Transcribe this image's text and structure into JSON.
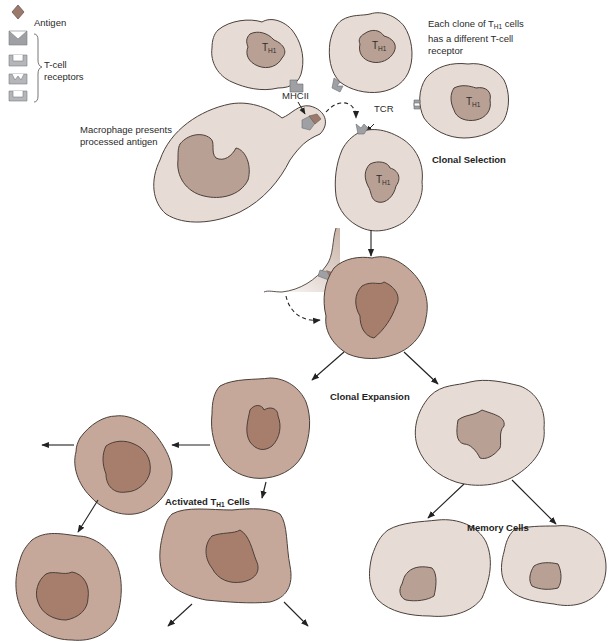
{
  "legend": {
    "antigen_label": "Antigen",
    "tcell_receptors_label_line1": "T-cell",
    "tcell_receptors_label_line2": "receptors"
  },
  "labels": {
    "clone_note_line1_prefix": "Each clone of T",
    "clone_note_line1_sub": "H1",
    "clone_note_line1_suffix": " cells",
    "clone_note_line2": "has a different T-cell",
    "clone_note_line3": "receptor",
    "mhcii": "MHCII",
    "tcr": "TCR",
    "macrophage_line1": "Macrophage presents",
    "macrophage_line2": "processed antigen",
    "clonal_selection": "Clonal Selection",
    "clonal_expansion": "Clonal Expansion",
    "activated_prefix": "Activated T",
    "activated_sub": "H1",
    "activated_suffix": " Cells",
    "memory_cells": "Memory Cells"
  },
  "cell_label": {
    "main": "T",
    "sub": "H1"
  },
  "colors": {
    "resting_cell": "#e6dcd5",
    "resting_nucleus": "#b9a094",
    "activated_cell": "#c6a89b",
    "activated_nucleus": "#a77d6c",
    "outline": "#4a4039",
    "receptor": "#9ea0a3",
    "antigen": "#9b7a6e"
  }
}
